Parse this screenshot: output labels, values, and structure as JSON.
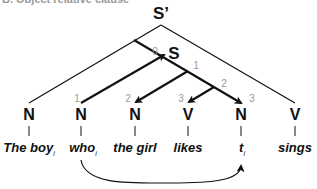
{
  "caption": "B. Object relative clause",
  "tree": {
    "root": "S’",
    "inner": "S",
    "nodes": [
      {
        "cat": "N",
        "word": "The boy",
        "index": "i",
        "x": 29
      },
      {
        "cat": "N",
        "word": "who",
        "index": "i",
        "x": 81,
        "num": "1"
      },
      {
        "cat": "N",
        "word": "the girl",
        "index": "",
        "x": 135,
        "num": "2"
      },
      {
        "cat": "V",
        "word": "likes",
        "index": "",
        "x": 188,
        "num": "3"
      },
      {
        "cat": "N",
        "word": "t",
        "index": "i",
        "x": 241,
        "num": "3"
      },
      {
        "cat": "V",
        "word": "sings",
        "index": "",
        "x": 295
      }
    ],
    "step_numbers": {
      "s0": "0",
      "s1": "1",
      "s2": "2"
    }
  },
  "colors": {
    "line": "#111111",
    "number": "#999999"
  }
}
